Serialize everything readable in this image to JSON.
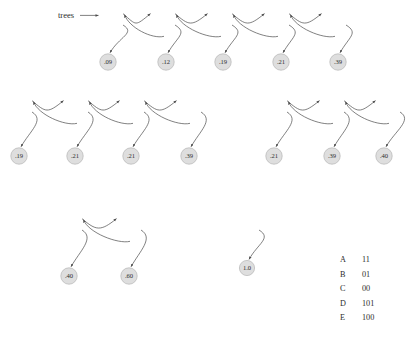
{
  "figure": {
    "title_label": "trees",
    "null_glyph": "\\",
    "rows": [
      {
        "id": "row-1",
        "boxes": [
          {
            "x": 100,
            "y": 8,
            "w": 24,
            "h": 34,
            "cells": [
              "ptr-right",
              "ptr-down",
              "null"
            ]
          },
          {
            "x": 152,
            "y": 8,
            "w": 24,
            "h": 34,
            "cells": [
              "ptr-right",
              "ptr-down",
              "ptr-left"
            ]
          },
          {
            "x": 209,
            "y": 8,
            "w": 24,
            "h": 34,
            "cells": [
              "ptr-right",
              "ptr-down",
              "ptr-left"
            ]
          },
          {
            "x": 266,
            "y": 8,
            "w": 24,
            "h": 34,
            "cells": [
              "ptr-right",
              "ptr-down",
              "ptr-left"
            ]
          },
          {
            "x": 323,
            "y": 8,
            "w": 24,
            "h": 34,
            "cells": [
              "ptr-right",
              "null",
              "ptr-left"
            ]
          }
        ],
        "trees": [
          {
            "root": {
              "label": ".09",
              "cx": 108,
              "cy": 62
            },
            "children": []
          },
          {
            "root": {
              "label": ".12",
              "cx": 166,
              "cy": 62
            },
            "children": []
          },
          {
            "root": {
              "label": ".19",
              "cx": 223,
              "cy": 62
            },
            "children": []
          },
          {
            "root": {
              "label": ".21",
              "cx": 281,
              "cy": 62
            },
            "children": []
          },
          {
            "root": {
              "label": ".39",
              "cx": 338,
              "cy": 62
            },
            "children": []
          }
        ]
      },
      {
        "id": "row-2-left",
        "boxes": [
          {
            "x": 9,
            "y": 95,
            "w": 24,
            "h": 34,
            "cells": [
              "ptr-right",
              "ptr-down",
              "null"
            ]
          },
          {
            "x": 65,
            "y": 95,
            "w": 24,
            "h": 34,
            "cells": [
              "ptr-right",
              "ptr-down",
              "ptr-left"
            ]
          },
          {
            "x": 121,
            "y": 95,
            "w": 24,
            "h": 34,
            "cells": [
              "ptr-right",
              "ptr-down",
              "ptr-left"
            ]
          },
          {
            "x": 178,
            "y": 95,
            "w": 24,
            "h": 34,
            "cells": [
              "ptr-right",
              "null",
              "ptr-left"
            ]
          }
        ],
        "trees": [
          {
            "root": {
              "label": ".19",
              "cx": 19,
              "cy": 156
            },
            "children": []
          },
          {
            "root": {
              "label": ".21",
              "cx": 75,
              "cy": 156
            },
            "children": []
          },
          {
            "root": {
              "label": ".21",
              "cx": 131,
              "cy": 156
            },
            "children": [
              {
                "label": ".09",
                "cx": 117,
                "cy": 179
              },
              {
                "label": ".12",
                "cx": 147,
                "cy": 179
              }
            ]
          },
          {
            "root": {
              "label": ".39",
              "cx": 189,
              "cy": 156
            },
            "children": []
          }
        ]
      },
      {
        "id": "row-2-right",
        "boxes": [
          {
            "x": 264,
            "y": 95,
            "w": 24,
            "h": 34,
            "cells": [
              "ptr-right",
              "ptr-down",
              "null"
            ]
          },
          {
            "x": 321,
            "y": 95,
            "w": 24,
            "h": 34,
            "cells": [
              "ptr-right",
              "ptr-down",
              "ptr-left"
            ]
          },
          {
            "x": 377,
            "y": 95,
            "w": 24,
            "h": 34,
            "cells": [
              "ptr-right",
              "null",
              "ptr-left"
            ]
          }
        ],
        "trees": [
          {
            "root": {
              "label": ".21",
              "cx": 274,
              "cy": 156
            },
            "children": [
              {
                "label": ".09",
                "cx": 260,
                "cy": 179
              },
              {
                "label": ".12",
                "cx": 289,
                "cy": 179
              }
            ]
          },
          {
            "root": {
              "label": ".39",
              "cx": 332,
              "cy": 156
            },
            "children": []
          },
          {
            "root": {
              "label": ".40",
              "cx": 384,
              "cy": 156
            },
            "children": [
              {
                "label": ".19",
                "cx": 370,
                "cy": 179
              },
              {
                "label": ".21",
                "cx": 399,
                "cy": 179
              }
            ]
          }
        ]
      },
      {
        "id": "row-3-left",
        "boxes": [
          {
            "x": 59,
            "y": 213,
            "w": 24,
            "h": 34,
            "cells": [
              "ptr-right",
              "ptr-down",
              "null"
            ]
          },
          {
            "x": 118,
            "y": 213,
            "w": 24,
            "h": 34,
            "cells": [
              "ptr-right",
              "null",
              "ptr-left"
            ]
          }
        ],
        "trees": [
          {
            "root": {
              "label": ".40",
              "cx": 69,
              "cy": 276
            },
            "children": [
              {
                "label": ".19",
                "cx": 48,
                "cy": 299
              },
              {
                "label": ".21",
                "cx": 88,
                "cy": 299
              }
            ]
          },
          {
            "root": {
              "label": ".60",
              "cx": 129,
              "cy": 276
            },
            "children": [
              {
                "label": ".21",
                "cx": 110,
                "cy": 299,
                "children": [
                  {
                    "label": ".09",
                    "cx": 97,
                    "cy": 322
                  },
                  {
                    "label": ".12",
                    "cx": 126,
                    "cy": 322
                  }
                ]
              },
              {
                "label": ".39",
                "cx": 148,
                "cy": 299
              }
            ]
          }
        ]
      },
      {
        "id": "row-3-right",
        "boxes": [
          {
            "x": 236,
            "y": 213,
            "w": 24,
            "h": 34,
            "cells": [
              "ptr-right",
              "null",
              "null"
            ]
          }
        ],
        "trees": [
          {
            "root": {
              "label": "1.0",
              "cx": 247,
              "cy": 268
            },
            "children": [
              {
                "label": ".40",
                "cx": 220,
                "cy": 291,
                "children": [
                  {
                    "label": ".19",
                    "cx": 203,
                    "cy": 314
                  },
                  {
                    "label": ".21",
                    "cx": 234,
                    "cy": 314
                  }
                ]
              },
              {
                "label": ".60",
                "cx": 272,
                "cy": 291,
                "children": [
                  {
                    "label": ".21",
                    "cx": 256,
                    "cy": 314,
                    "children": [
                      {
                        "label": ".09",
                        "cx": 243,
                        "cy": 337
                      },
                      {
                        "label": ".12",
                        "cx": 272,
                        "cy": 337
                      }
                    ]
                  },
                  {
                    "label": ".39",
                    "cx": 291,
                    "cy": 314
                  }
                ]
              }
            ]
          }
        ]
      }
    ]
  },
  "code_table": {
    "rows": [
      {
        "symbol": "A",
        "code": "11"
      },
      {
        "symbol": "B",
        "code": "01"
      },
      {
        "symbol": "C",
        "code": "00"
      },
      {
        "symbol": "D",
        "code": "101"
      },
      {
        "symbol": "E",
        "code": "100"
      }
    ]
  }
}
